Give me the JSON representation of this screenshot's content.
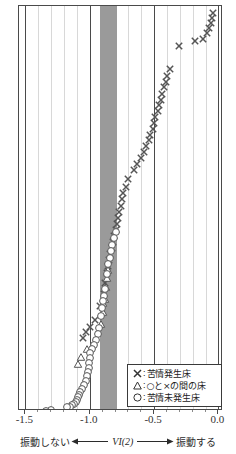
{
  "chart_data": {
    "type": "scatter",
    "title": "",
    "xlabel": "VI(2)",
    "ylabel": "",
    "xlim": [
      -1.55,
      0.02
    ],
    "ylim": [
      0,
      100
    ],
    "grid": true,
    "grid_minor_step": 0.1,
    "grid_major_step": 0.5,
    "axis_tick_labels": [
      "-1.5",
      "-1.0",
      "-0.5",
      "0.0"
    ],
    "axis_tick_values": [
      -1.5,
      -1.0,
      -0.5,
      0.0
    ],
    "shaded_band": {
      "label": "",
      "x_start": -0.92,
      "x_end": -0.79,
      "color": "#9a9a9a"
    },
    "legend_position": "bottom-right",
    "series": [
      {
        "name": "苦情発生床",
        "marker": "x",
        "points": [
          [
            -0.04,
            98.3
          ],
          [
            -0.05,
            97.0
          ],
          [
            -0.06,
            95.8
          ],
          [
            -0.07,
            94.5
          ],
          [
            -0.09,
            93.2
          ],
          [
            -0.12,
            91.8
          ],
          [
            -0.18,
            91.3
          ],
          [
            -0.31,
            90.0
          ],
          [
            -0.38,
            84.5
          ],
          [
            -0.4,
            82.6
          ],
          [
            -0.41,
            81.2
          ],
          [
            -0.42,
            79.8
          ],
          [
            -0.44,
            78.3
          ],
          [
            -0.45,
            76.8
          ],
          [
            -0.46,
            75.4
          ],
          [
            -0.47,
            74.0
          ],
          [
            -0.49,
            72.5
          ],
          [
            -0.5,
            71.0
          ],
          [
            -0.51,
            69.5
          ],
          [
            -0.53,
            68.1
          ],
          [
            -0.54,
            66.7
          ],
          [
            -0.56,
            65.2
          ],
          [
            -0.58,
            63.8
          ],
          [
            -0.6,
            62.3
          ],
          [
            -0.63,
            60.9
          ],
          [
            -0.66,
            59.4
          ],
          [
            -0.7,
            57.0
          ],
          [
            -0.72,
            55.2
          ],
          [
            -0.74,
            53.5
          ],
          [
            -0.75,
            52.0
          ],
          [
            -0.76,
            50.5
          ],
          [
            -0.77,
            49.0
          ],
          [
            -0.78,
            47.5
          ],
          [
            -0.79,
            46.0
          ],
          [
            -0.8,
            44.5
          ],
          [
            -0.81,
            43.0
          ],
          [
            -0.82,
            41.5
          ],
          [
            -0.83,
            40.0
          ],
          [
            -0.84,
            38.4
          ],
          [
            -0.85,
            36.9
          ],
          [
            -0.86,
            35.4
          ],
          [
            -0.87,
            33.8
          ],
          [
            -0.88,
            31.2
          ],
          [
            -0.89,
            28.6
          ],
          [
            -0.92,
            25.5
          ],
          [
            -0.96,
            22.0
          ],
          [
            -1.0,
            20.4
          ],
          [
            -1.03,
            19.0
          ],
          [
            -1.05,
            17.6
          ]
        ]
      },
      {
        "name": "○と×の間の床",
        "marker": "triangle",
        "points": [
          [
            -0.855,
            34.6
          ],
          [
            -0.865,
            32.5
          ],
          [
            -0.875,
            30.2
          ],
          [
            -0.885,
            27.4
          ],
          [
            -0.895,
            26.2
          ],
          [
            -0.9,
            24.0
          ],
          [
            -0.915,
            21.0
          ],
          [
            -1.02,
            14.9
          ],
          [
            -1.07,
            13.0
          ],
          [
            -1.09,
            11.3
          ]
        ]
      },
      {
        "name": "苦情未発生床",
        "marker": "circle",
        "points": [
          [
            -0.8,
            44.0
          ],
          [
            -0.815,
            42.4
          ],
          [
            -0.825,
            40.8
          ],
          [
            -0.835,
            39.2
          ],
          [
            -0.845,
            37.6
          ],
          [
            -0.86,
            36.0
          ],
          [
            -0.87,
            33.4
          ],
          [
            -0.88,
            29.8
          ],
          [
            -0.89,
            28.0
          ],
          [
            -0.9,
            26.8
          ],
          [
            -0.905,
            25.0
          ],
          [
            -0.91,
            23.2
          ],
          [
            -0.925,
            20.0
          ],
          [
            -0.94,
            18.6
          ],
          [
            -0.955,
            17.2
          ],
          [
            -0.97,
            16.0
          ],
          [
            -0.985,
            15.0
          ],
          [
            -0.995,
            13.8
          ],
          [
            -1.0,
            12.6
          ],
          [
            -1.005,
            11.5
          ],
          [
            -1.01,
            10.3
          ],
          [
            -1.015,
            9.2
          ],
          [
            -1.02,
            8.1
          ],
          [
            -1.03,
            7.0
          ],
          [
            -1.045,
            6.0
          ],
          [
            -1.06,
            5.0
          ],
          [
            -1.075,
            4.2
          ],
          [
            -1.085,
            3.5
          ],
          [
            -1.095,
            2.9
          ],
          [
            -1.1,
            2.3
          ],
          [
            -1.11,
            1.8
          ],
          [
            -1.125,
            1.3
          ],
          [
            -1.14,
            0.9
          ],
          [
            -1.155,
            0.6
          ],
          [
            -1.175,
            0.4
          ],
          [
            -1.3,
            -0.2
          ],
          [
            -1.34,
            -0.5
          ],
          [
            -1.46,
            -0.9
          ]
        ]
      }
    ]
  },
  "legend": {
    "items": [
      {
        "symbol": "x",
        "separator": ":",
        "label": "苦情発生床"
      },
      {
        "symbol": "triangle",
        "separator": ":",
        "label": "○と×の間の床"
      },
      {
        "symbol": "circle",
        "separator": ":",
        "label": "苦情未発生床"
      }
    ]
  },
  "axis": {
    "ticks": [
      {
        "value": -1.5,
        "label": "-1.5"
      },
      {
        "value": -1.0,
        "label": "-1.0"
      },
      {
        "value": -0.5,
        "label": "-0.5"
      },
      {
        "value": 0.0,
        "label": "0.0"
      }
    ]
  },
  "caption": {
    "left_text": "振動しない",
    "axis_name": "VI(2)",
    "right_text": "振動する"
  },
  "colors": {
    "frame": "#4a4a4a",
    "gridline_minor": "#d8d8d8",
    "gridline_major": "#4a4a4a",
    "band": "#9a9a9a",
    "marker": "#555555",
    "text": "#2b2b2b"
  }
}
